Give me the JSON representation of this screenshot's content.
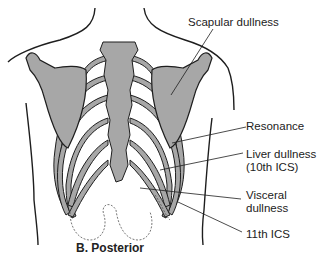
{
  "figure": {
    "caption": "B.  Posterior",
    "view": "posterior thorax",
    "colors": {
      "bone_fill": "#a7a7a7",
      "outline": "#1e1e1e",
      "background": "#ffffff"
    },
    "labels": [
      {
        "id": "scapular",
        "text": "Scapular dullness"
      },
      {
        "id": "resonance",
        "text": "Resonance"
      },
      {
        "id": "liver_1",
        "text": "Liver dullness"
      },
      {
        "id": "liver_2",
        "text": "(10th ICS)"
      },
      {
        "id": "visceral_1",
        "text": "Visceral"
      },
      {
        "id": "visceral_2",
        "text": "dullness"
      },
      {
        "id": "ics11",
        "text": "11th ICS"
      }
    ]
  }
}
